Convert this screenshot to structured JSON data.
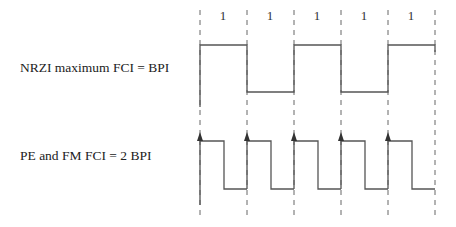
{
  "diagram": {
    "labels": {
      "nrzi": "NRZI maximum FCI = BPI",
      "pe_fm": "PE and FM FCI = 2 BPI"
    },
    "bits": [
      "1",
      "1",
      "1",
      "1",
      "1"
    ],
    "cell_boundaries_x": [
      200,
      247,
      294,
      341,
      388,
      435
    ],
    "nrzi_waveform": {
      "high_y": 45,
      "low_y": 92,
      "levels": [
        "high",
        "low",
        "high",
        "low",
        "high"
      ]
    },
    "pe_fm_waveform": {
      "high_y": 141,
      "low_y": 189,
      "pattern": "flux reversal at every cell boundary (arrow) and mid-cell"
    },
    "colors": {
      "line": "#555555",
      "dash": "#666666",
      "text": "#222222"
    }
  }
}
